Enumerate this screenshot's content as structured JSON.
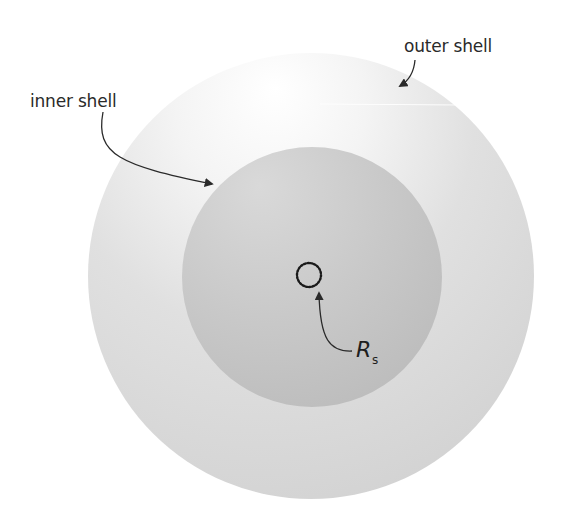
{
  "diagram": {
    "colors": {
      "background": "#ffffff",
      "outer_shell_fill": "#d6d6d6",
      "outer_shell_highlight": "#ffffff",
      "inner_shell_fill": "#bfbfbf",
      "inner_shell_highlight": "#dedede",
      "annotation_stroke": "#2a2a2a",
      "dotted_circle": "#1a1a1a"
    },
    "shapes": {
      "outer_shell": {
        "cx": 311,
        "cy": 276,
        "r": 223
      },
      "inner_shell": {
        "cx": 312,
        "cy": 277,
        "r": 130
      },
      "schwarzschild_circle": {
        "cx": 309,
        "cy": 275,
        "r": 12,
        "style": "dotted"
      }
    },
    "labels": {
      "outer_shell": "outer shell",
      "inner_shell": "inner shell",
      "radius_symbol": "R",
      "radius_subscript": "s"
    },
    "arrows": [
      {
        "from_label": "outer shell",
        "target": "outer shell edge"
      },
      {
        "from_label": "inner shell",
        "target": "inner shell edge"
      },
      {
        "from_label": "R_s",
        "target": "dotted circle"
      }
    ]
  }
}
